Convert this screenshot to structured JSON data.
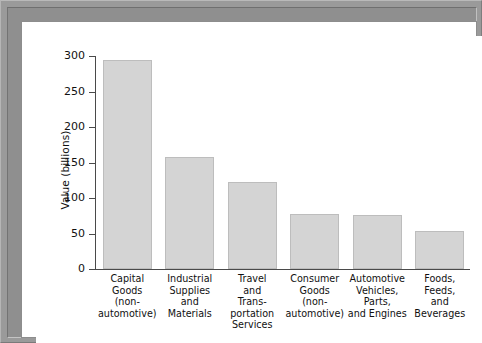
{
  "chart_data": {
    "type": "bar",
    "title": "",
    "subtitle": "",
    "xlabel": "",
    "ylabel": "Value (billions)",
    "ylim": [
      0,
      300
    ],
    "yticks": [
      0,
      50,
      100,
      150,
      200,
      250,
      300
    ],
    "ytick_labels": [
      "0",
      "50",
      "100",
      "150",
      "200",
      "250",
      "300"
    ],
    "grid": false,
    "legend": false,
    "categories": [
      "Capital\nGoods\n(non-\nautomotive)",
      "Industrial\nSupplies\nand\nMaterials",
      "Travel\nand\nTrans-\nportation\nServices",
      "Consumer\nGoods\n(non-\nautomotive)",
      "Automotive\nVehicles,\nParts,\nand Engines",
      "Foods,\nFeeds,\nand\nBeverages"
    ],
    "values": [
      295,
      158,
      122,
      78,
      76,
      54
    ],
    "bar_color": "#d4d4d4",
    "bar_border_color": "#bdbdbd",
    "axis_color": "#4a4a4a"
  },
  "frame": {
    "outer_color": "#9a9a9a",
    "inner_background": "#ffffff"
  }
}
